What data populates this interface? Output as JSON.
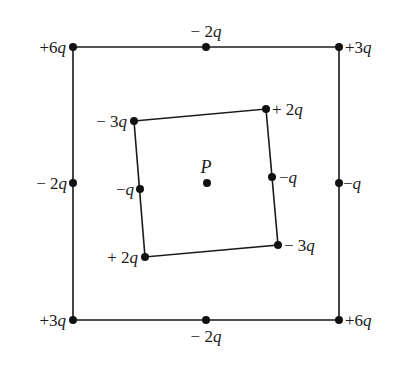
{
  "diagram": {
    "type": "point-charge-configuration",
    "center_point": {
      "label": "P",
      "x": 207,
      "y": 183
    },
    "outer_square": {
      "corners": [
        {
          "id": "top-left",
          "x": 73,
          "y": 47,
          "charge": "+6q",
          "label_anchor": "end",
          "lx": 66,
          "ly": 53
        },
        {
          "id": "top-right",
          "x": 339,
          "y": 47,
          "charge": "+3q",
          "label_anchor": "start",
          "lx": 345,
          "ly": 53
        },
        {
          "id": "bottom-right",
          "x": 339,
          "y": 320,
          "charge": "+6q",
          "label_anchor": "start",
          "lx": 345,
          "ly": 326
        },
        {
          "id": "bottom-left",
          "x": 73,
          "y": 320,
          "charge": "+3q",
          "label_anchor": "end",
          "lx": 66,
          "ly": 326
        }
      ],
      "midpoints": [
        {
          "id": "top-mid",
          "x": 206,
          "y": 47,
          "charge": "− 2q",
          "label_anchor": "middle",
          "lx": 206,
          "ly": 37
        },
        {
          "id": "right-mid",
          "x": 339,
          "y": 183,
          "charge": "−q",
          "label_anchor": "start",
          "lx": 343,
          "ly": 189
        },
        {
          "id": "bottom-mid",
          "x": 206,
          "y": 320,
          "charge": "− 2q",
          "label_anchor": "middle",
          "lx": 206,
          "ly": 342
        },
        {
          "id": "left-mid",
          "x": 73,
          "y": 183,
          "charge": "− 2q",
          "label_anchor": "end",
          "lx": 67,
          "ly": 189
        }
      ]
    },
    "inner_square": {
      "corners": [
        {
          "id": "top-left",
          "x": 134,
          "y": 121,
          "charge": "− 3q",
          "label_anchor": "end",
          "lx": 127,
          "ly": 127
        },
        {
          "id": "top-right",
          "x": 266,
          "y": 109,
          "charge": "+ 2q",
          "label_anchor": "start",
          "lx": 272,
          "ly": 115
        },
        {
          "id": "bottom-right",
          "x": 278,
          "y": 245,
          "charge": "− 3q",
          "label_anchor": "start",
          "lx": 284,
          "ly": 251
        },
        {
          "id": "bottom-left",
          "x": 145,
          "y": 257,
          "charge": "+ 2q",
          "label_anchor": "end",
          "lx": 138,
          "ly": 263
        }
      ],
      "midpoints": [
        {
          "id": "right-mid",
          "x": 272,
          "y": 177,
          "charge": "−q",
          "label_anchor": "start",
          "lx": 279,
          "ly": 183
        },
        {
          "id": "left-mid",
          "x": 140,
          "y": 189,
          "charge": "−q",
          "label_anchor": "end",
          "lx": 134,
          "ly": 195
        }
      ]
    },
    "colors": {
      "line": "#1a1a1a",
      "dot": "#111111",
      "background": "#ffffff"
    }
  }
}
